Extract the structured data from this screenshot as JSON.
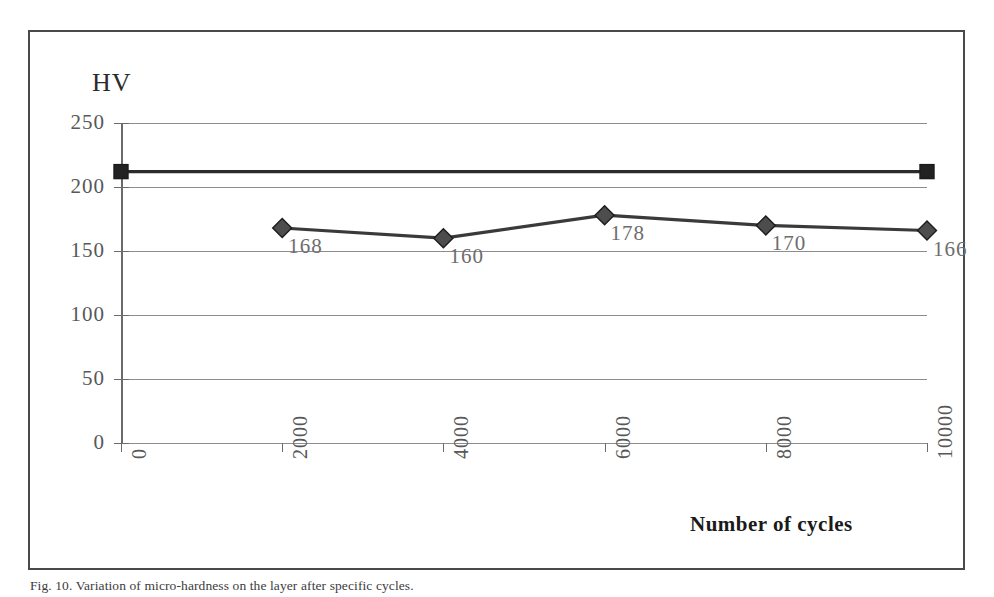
{
  "figure": {
    "caption": "Fig. 10. Variation of micro-hardness on the layer after specific cycles."
  },
  "chart_data": {
    "type": "line",
    "title": "",
    "xlabel": "Number of cycles",
    "ylabel": "HV",
    "xlim": [
      0,
      10000
    ],
    "ylim": [
      0,
      250
    ],
    "xticks": [
      "0",
      "2000",
      "4000",
      "6000",
      "8000",
      "10000"
    ],
    "yticks": [
      "0",
      "50",
      "100",
      "150",
      "200",
      "250"
    ],
    "grid": true,
    "legend": "none",
    "series": [
      {
        "name": "substrate-reference",
        "marker": "square",
        "color": "#2b2b2b",
        "x": [
          0,
          10000
        ],
        "values": [
          212,
          212
        ],
        "labels": [
          "",
          ""
        ]
      },
      {
        "name": "layer-microhardness",
        "marker": "diamond",
        "color": "#3a3a3a",
        "x": [
          2000,
          4000,
          6000,
          8000,
          10000
        ],
        "values": [
          168,
          160,
          178,
          170,
          166
        ],
        "labels": [
          "168",
          "160",
          "178",
          "170",
          "166"
        ]
      }
    ]
  }
}
